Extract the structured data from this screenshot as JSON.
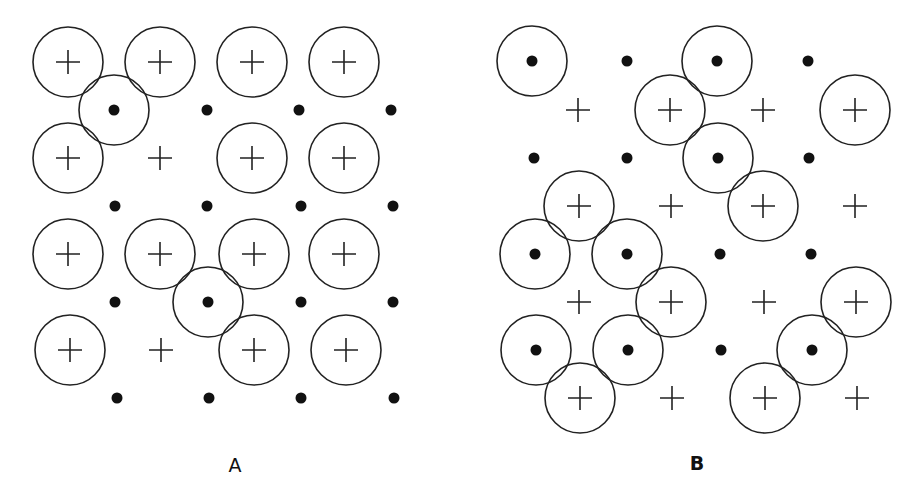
{
  "panels": [
    {
      "label": "A",
      "label_pos": [
        235,
        465
      ],
      "crosses": [
        [
          68,
          62,
          1
        ],
        [
          160,
          62,
          1
        ],
        [
          252,
          62,
          1
        ],
        [
          344,
          62,
          1
        ],
        [
          68,
          158,
          1
        ],
        [
          160,
          158,
          0
        ],
        [
          252,
          158,
          1
        ],
        [
          344,
          158,
          1
        ],
        [
          68,
          254,
          1
        ],
        [
          160,
          254,
          1
        ],
        [
          254,
          254,
          1
        ],
        [
          344,
          254,
          1
        ],
        [
          70,
          350,
          1
        ],
        [
          161,
          350,
          0
        ],
        [
          254,
          350,
          1
        ],
        [
          346,
          350,
          1
        ]
      ],
      "dots": [
        [
          114,
          110,
          1
        ],
        [
          207,
          110,
          0
        ],
        [
          299,
          110,
          0
        ],
        [
          391,
          110,
          0
        ],
        [
          115,
          206,
          0
        ],
        [
          207,
          206,
          0
        ],
        [
          301,
          206,
          0
        ],
        [
          393,
          206,
          0
        ],
        [
          115,
          302,
          0
        ],
        [
          208,
          302,
          1
        ],
        [
          301,
          302,
          0
        ],
        [
          393,
          302,
          0
        ],
        [
          117,
          398,
          0
        ],
        [
          209,
          398,
          0
        ],
        [
          301,
          398,
          0
        ],
        [
          394,
          398,
          0
        ]
      ]
    },
    {
      "label": "B",
      "label_pos": [
        697,
        463
      ],
      "dots": [
        [
          532,
          61,
          1
        ],
        [
          627,
          61,
          0
        ],
        [
          717,
          61,
          1
        ],
        [
          808,
          61,
          0
        ],
        [
          534,
          158,
          0
        ],
        [
          627,
          158,
          0
        ],
        [
          718,
          158,
          1
        ],
        [
          809,
          158,
          0
        ],
        [
          535,
          254,
          1
        ],
        [
          627,
          254,
          1
        ],
        [
          720,
          254,
          0
        ],
        [
          811,
          254,
          0
        ],
        [
          536,
          350,
          1
        ],
        [
          628,
          350,
          1
        ],
        [
          721,
          350,
          0
        ],
        [
          812,
          350,
          1
        ]
      ],
      "crosses": [
        [
          578,
          110,
          0
        ],
        [
          670,
          110,
          1
        ],
        [
          763,
          110,
          0
        ],
        [
          855,
          110,
          1
        ],
        [
          579,
          206,
          1
        ],
        [
          671,
          206,
          0
        ],
        [
          763,
          206,
          1
        ],
        [
          855,
          206,
          0
        ],
        [
          579,
          302,
          0
        ],
        [
          671,
          302,
          1
        ],
        [
          764,
          302,
          0
        ],
        [
          856,
          302,
          1
        ],
        [
          580,
          398,
          1
        ],
        [
          672,
          398,
          0
        ],
        [
          765,
          398,
          1
        ],
        [
          857,
          398,
          0
        ]
      ]
    }
  ],
  "style": {
    "radius": 35,
    "stroke": "#222222",
    "dot_radius": 5.5,
    "cross_half": 12
  }
}
